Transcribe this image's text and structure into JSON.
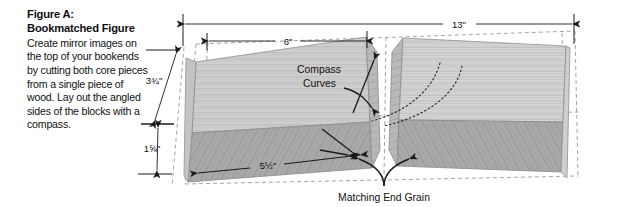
{
  "caption": {
    "title_line1": "Figure A:",
    "title_line2": "Bookmatched Figure",
    "body": "Create mirror images on the top of your bookends by cutting both core pieces from a single piece of wood. Lay out the angled sides of the blocks with a compass."
  },
  "dimensions": {
    "overall_width": "13\"",
    "inner_width": "6\"",
    "block_height_total": "3¾\"",
    "block_height_lower": "1⅝\"",
    "block_length": "5½\""
  },
  "annotations": {
    "compass_curves_line1": "Compass",
    "compass_curves_line2": "Curves",
    "matching_end_grain": "Matching End Grain"
  },
  "colors": {
    "top_face": "#d2d2d2",
    "front_face": "#a9a9a9",
    "grain_dark": "#8d8d8d",
    "grain_light": "#e2e2e2",
    "line": "#1a1a1a",
    "dashed": "#9a9a9a",
    "text": "#111111"
  }
}
